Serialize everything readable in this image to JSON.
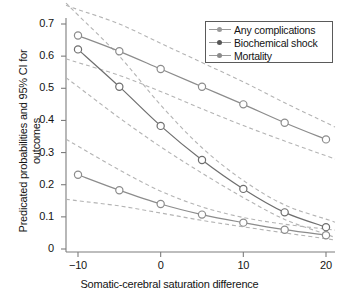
{
  "chart_data": {
    "type": "line",
    "title": "",
    "xlabel": "Somatic-cerebral saturation difference",
    "ylabel": "Predicated probabilities and 95% CI for outcomes",
    "xlim": [
      -11.5,
      21.5
    ],
    "ylim": [
      0,
      0.745
    ],
    "xticks": [
      -10,
      0,
      10,
      20
    ],
    "xticklabels": [
      "-10",
      "0",
      "10",
      "20"
    ],
    "yticks": [
      0,
      0.1,
      0.2,
      0.3,
      0.4,
      0.5,
      0.6,
      0.7
    ],
    "yticklabels": [
      "0",
      "0.1",
      "0.2",
      "0.3",
      "0.4",
      "0.5",
      "0.6",
      "0.7"
    ],
    "grid": false,
    "legend_position": "top-right",
    "marker": "open-circle",
    "ci_style": "dashed",
    "x": [
      -10,
      -5,
      0,
      5,
      10,
      15,
      20
    ],
    "series": [
      {
        "name": "Any complications",
        "color": "#8c8c8c",
        "values": [
          0.664,
          0.615,
          0.56,
          0.505,
          0.45,
          0.393,
          0.341
        ],
        "ci_upper": [
          0.745,
          0.7,
          0.64,
          0.58,
          0.52,
          0.455,
          0.393
        ],
        "ci_lower": [
          0.58,
          0.54,
          0.49,
          0.436,
          0.384,
          0.336,
          0.29
        ]
      },
      {
        "name": "Biochemical shock",
        "color": "#6e6e6e",
        "values": [
          0.621,
          0.505,
          0.383,
          0.277,
          0.187,
          0.114,
          0.068
        ],
        "ci_upper": [
          0.728,
          0.6,
          0.448,
          0.315,
          0.213,
          0.137,
          0.093
        ],
        "ci_lower": [
          0.505,
          0.408,
          0.318,
          0.236,
          0.16,
          0.092,
          0.046
        ]
      },
      {
        "name": "Mortality",
        "color": "#8c8c8c",
        "values": [
          0.231,
          0.183,
          0.14,
          0.107,
          0.082,
          0.06,
          0.043
        ],
        "ci_upper": [
          0.32,
          0.246,
          0.18,
          0.131,
          0.098,
          0.077,
          0.062
        ],
        "ci_lower": [
          0.15,
          0.134,
          0.112,
          0.089,
          0.069,
          0.05,
          0.032
        ]
      }
    ]
  },
  "legend": {
    "items": [
      {
        "label": "Any complications"
      },
      {
        "label": "Biochemical shock"
      },
      {
        "label": "Mortality"
      }
    ]
  },
  "axes": {
    "x_title": "Somatic-cerebral saturation difference",
    "y_title": "Predicated probabilities and 95% CI for outcomes"
  }
}
